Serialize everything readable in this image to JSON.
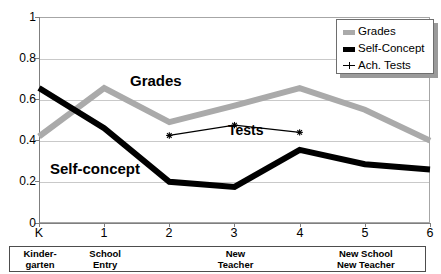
{
  "chart_data": {
    "type": "line",
    "title": "",
    "xlabel": "",
    "ylabel": "",
    "x": [
      "K",
      "1",
      "2",
      "3",
      "4",
      "5",
      "6"
    ],
    "xtick_labels": [
      "K",
      "1",
      "2",
      "3",
      "4",
      "5",
      "6"
    ],
    "ytick_labels": [
      "0",
      "0.2",
      "0.4",
      "0.6",
      "0.8",
      "1"
    ],
    "ylim": [
      0,
      1
    ],
    "yticks": [
      0,
      0.2,
      0.4,
      0.6,
      0.8,
      1
    ],
    "grid": true,
    "legend_position": "top-right",
    "series": [
      {
        "name": "Grades",
        "color": "#aaaaaa",
        "values": [
          0.42,
          0.655,
          0.49,
          0.57,
          0.655,
          0.55,
          0.4
        ],
        "x": [
          "K",
          "1",
          "2",
          "3",
          "4",
          "5",
          "6"
        ]
      },
      {
        "name": "Self-Concept",
        "color": "#000000",
        "values": [
          0.655,
          0.46,
          0.2,
          0.175,
          0.355,
          0.285,
          0.26
        ],
        "x": [
          "K",
          "1",
          "2",
          "3",
          "4",
          "5",
          "6"
        ]
      },
      {
        "name": "Ach. Tests",
        "color": "#000000",
        "values": [
          0.425,
          0.475,
          0.44
        ],
        "x": [
          "2",
          "3",
          "4"
        ]
      }
    ],
    "annotations": [
      {
        "text": "Grades",
        "x": 1.55,
        "y": 0.645
      },
      {
        "text": "Self-concept",
        "x": 0.25,
        "y": 0.225
      },
      {
        "text": "Tests",
        "x": 3.05,
        "y": 0.42
      }
    ]
  },
  "legend": {
    "title": "",
    "items": [
      {
        "label": "Grades",
        "swatch": "thick-gray-line-swatch"
      },
      {
        "label": "Self-Concept",
        "swatch": "thick-black-line-swatch"
      },
      {
        "label": "Ach. Tests",
        "swatch": "thin-line-star-marker-swatch"
      }
    ]
  },
  "annotations": {
    "grades": "Grades",
    "self_concept": "Self-concept",
    "tests": "Tests"
  },
  "axes": {
    "y_ticks": [
      "1",
      "0.8",
      "0.6",
      "0.4",
      "0.2",
      "0"
    ],
    "x_ticks": [
      "K",
      "1",
      "2",
      "3",
      "4",
      "5",
      "6"
    ]
  },
  "phase_box": {
    "cells": [
      {
        "label": "Kinder-\ngarten",
        "center_x": 0.0
      },
      {
        "label": "School\nEntry",
        "center_x": 1.0
      },
      {
        "label": "New\nTeacher",
        "center_x": 3.0
      },
      {
        "label": "New School\nNew Teacher",
        "center_x": 5.0
      }
    ]
  }
}
